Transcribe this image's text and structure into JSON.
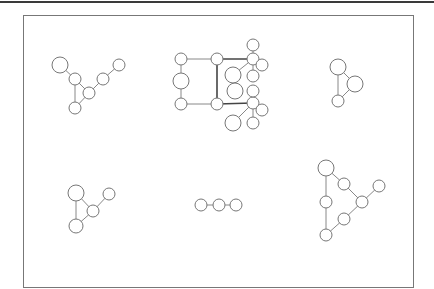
{
  "diagram": {
    "type": "graph-collection",
    "frame": {
      "x": 23,
      "y": 15,
      "width": 390,
      "height": 272
    },
    "graphs": [
      {
        "id": "graph-1",
        "nodes": [
          {
            "x": 60,
            "y": 65,
            "r": 8
          },
          {
            "x": 75,
            "y": 79,
            "r": 6
          },
          {
            "x": 89,
            "y": 93,
            "r": 6
          },
          {
            "x": 103,
            "y": 79,
            "r": 6
          },
          {
            "x": 119,
            "y": 65,
            "r": 6
          },
          {
            "x": 75,
            "y": 108,
            "r": 6
          }
        ],
        "edges": [
          [
            0,
            1
          ],
          [
            1,
            5
          ],
          [
            1,
            2
          ],
          [
            2,
            5
          ],
          [
            2,
            3
          ],
          [
            3,
            4
          ]
        ]
      },
      {
        "id": "graph-2",
        "nodes": [
          {
            "x": 181,
            "y": 59,
            "r": 6
          },
          {
            "x": 181,
            "y": 81,
            "r": 8
          },
          {
            "x": 181,
            "y": 104,
            "r": 6
          },
          {
            "x": 217,
            "y": 59,
            "r": 6
          },
          {
            "x": 217,
            "y": 104,
            "r": 6
          },
          {
            "x": 253,
            "y": 59,
            "r": 6
          },
          {
            "x": 253,
            "y": 45,
            "r": 6
          },
          {
            "x": 262,
            "y": 65,
            "r": 6
          },
          {
            "x": 233,
            "y": 75,
            "r": 8
          },
          {
            "x": 253,
            "y": 76,
            "r": 6
          },
          {
            "x": 253,
            "y": 103,
            "r": 6
          },
          {
            "x": 253,
            "y": 91,
            "r": 6
          },
          {
            "x": 262,
            "y": 110,
            "r": 6
          },
          {
            "x": 233,
            "y": 123,
            "r": 8
          },
          {
            "x": 253,
            "y": 123,
            "r": 6
          },
          {
            "x": 235,
            "y": 91,
            "r": 8
          }
        ],
        "edges": [
          [
            0,
            3
          ],
          [
            0,
            1
          ],
          [
            1,
            2
          ],
          [
            2,
            4
          ],
          [
            5,
            6
          ],
          [
            5,
            7
          ],
          [
            5,
            8
          ],
          [
            5,
            9
          ],
          [
            10,
            11
          ],
          [
            10,
            12
          ],
          [
            10,
            13
          ],
          [
            10,
            14
          ]
        ],
        "bold_edges": [
          [
            3,
            4
          ],
          [
            3,
            5
          ],
          [
            4,
            10
          ]
        ]
      },
      {
        "id": "graph-3",
        "nodes": [
          {
            "x": 338,
            "y": 67,
            "r": 8
          },
          {
            "x": 355,
            "y": 84,
            "r": 8
          },
          {
            "x": 338,
            "y": 101,
            "r": 6
          }
        ],
        "edges": [
          [
            0,
            2
          ],
          [
            0,
            1
          ],
          [
            1,
            2
          ]
        ]
      },
      {
        "id": "graph-4",
        "nodes": [
          {
            "x": 76,
            "y": 193,
            "r": 8
          },
          {
            "x": 93,
            "y": 211,
            "r": 6
          },
          {
            "x": 109,
            "y": 194,
            "r": 6
          },
          {
            "x": 76,
            "y": 226,
            "r": 7
          }
        ],
        "edges": [
          [
            0,
            3
          ],
          [
            0,
            1
          ],
          [
            1,
            3
          ],
          [
            1,
            2
          ]
        ]
      },
      {
        "id": "graph-5",
        "nodes": [
          {
            "x": 201,
            "y": 205,
            "r": 6
          },
          {
            "x": 219,
            "y": 205,
            "r": 6
          },
          {
            "x": 236,
            "y": 205,
            "r": 6
          }
        ],
        "edges": [
          [
            0,
            1
          ],
          [
            1,
            2
          ]
        ]
      },
      {
        "id": "graph-6",
        "nodes": [
          {
            "x": 326,
            "y": 168,
            "r": 8
          },
          {
            "x": 344,
            "y": 184,
            "r": 6
          },
          {
            "x": 362,
            "y": 202,
            "r": 6
          },
          {
            "x": 379,
            "y": 186,
            "r": 6
          },
          {
            "x": 326,
            "y": 202,
            "r": 6
          },
          {
            "x": 344,
            "y": 219,
            "r": 6
          },
          {
            "x": 326,
            "y": 235,
            "r": 6
          }
        ],
        "edges": [
          [
            0,
            1
          ],
          [
            1,
            2
          ],
          [
            2,
            3
          ],
          [
            2,
            5
          ],
          [
            5,
            6
          ],
          [
            0,
            4
          ],
          [
            4,
            6
          ]
        ]
      }
    ]
  }
}
